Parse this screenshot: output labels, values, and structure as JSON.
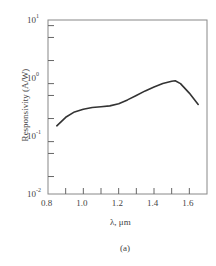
{
  "chart_data": {
    "type": "line",
    "title": "",
    "xlabel": "λ, μm",
    "ylabel": "Responsivity (A/W)",
    "yscale": "log",
    "xlim": [
      0.8,
      1.7
    ],
    "ylim": [
      0.01,
      10
    ],
    "x_ticks": [
      "0.8",
      "1.0",
      "1.2",
      "1.4",
      "1.6"
    ],
    "y_ticks": [
      {
        "base": "10",
        "exp": "1"
      },
      {
        "base": "10",
        "exp": "0"
      },
      {
        "base": "10",
        "exp": "-1"
      },
      {
        "base": "10",
        "exp": "-2"
      }
    ],
    "grid": false,
    "series": [
      {
        "name": "Responsivity",
        "x": [
          0.85,
          0.9,
          0.95,
          1.0,
          1.05,
          1.1,
          1.15,
          1.2,
          1.25,
          1.3,
          1.35,
          1.4,
          1.45,
          1.5,
          1.52,
          1.55,
          1.6,
          1.65
        ],
        "values": [
          0.15,
          0.21,
          0.26,
          0.29,
          0.31,
          0.32,
          0.33,
          0.36,
          0.42,
          0.5,
          0.6,
          0.7,
          0.8,
          0.88,
          0.9,
          0.8,
          0.55,
          0.35
        ]
      }
    ],
    "caption": "(a)"
  }
}
